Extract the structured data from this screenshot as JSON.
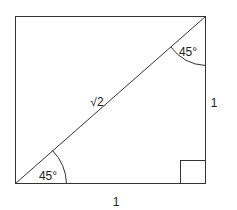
{
  "diagram": {
    "type": "right-isosceles-triangle-in-square",
    "labels": {
      "hypotenuse": "√2",
      "right_side": "1",
      "bottom_side": "1",
      "angle_top": "45°",
      "angle_bottom": "45°"
    },
    "colors": {
      "stroke": "#333333",
      "background": "#ffffff"
    }
  }
}
